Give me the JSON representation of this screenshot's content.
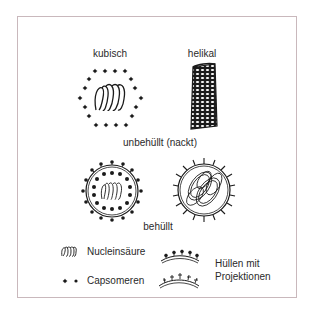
{
  "diagram": {
    "labels": {
      "cubic": "kubisch",
      "helical": "helikal",
      "non_enveloped": "unbehüllt (nackt)",
      "enveloped": "behüllt"
    },
    "legend": {
      "nucleic_acid": "Nucleinsäure",
      "capsomeres": "Capsomeren",
      "envelopes_line1": "Hüllen mit",
      "envelopes_line2": "Projektionen"
    },
    "colors": {
      "ink": "#1a1a1a",
      "frame_border": "#c9b8bc",
      "background": "#ffffff"
    }
  }
}
